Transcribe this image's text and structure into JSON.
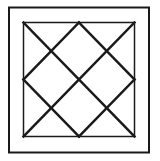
{
  "diagram": {
    "colors": {
      "background": "#ffffff",
      "stroke": "#1a1a1a"
    },
    "outer_frame": {
      "x": 9,
      "y": 7.5,
      "width": 140,
      "height": 145,
      "stroke_width": 2
    },
    "inner_square": {
      "x": 23.5,
      "y": 22.5,
      "width": 111,
      "height": 114,
      "stroke_width": 1.5
    },
    "lattice_lines": [
      {
        "x1": 23.5,
        "y1": 22.5,
        "x2": 134.5,
        "y2": 136.5
      },
      {
        "x1": 79,
        "y1": 22.5,
        "x2": 134.5,
        "y2": 79.5
      },
      {
        "x1": 23.5,
        "y1": 79.5,
        "x2": 79,
        "y2": 136.5
      },
      {
        "x1": 134.5,
        "y1": 22.5,
        "x2": 23.5,
        "y2": 136.5
      },
      {
        "x1": 79,
        "y1": 22.5,
        "x2": 23.5,
        "y2": 79.5
      },
      {
        "x1": 134.5,
        "y1": 79.5,
        "x2": 79,
        "y2": 136.5
      }
    ],
    "lattice_stroke_width": 2.5
  }
}
